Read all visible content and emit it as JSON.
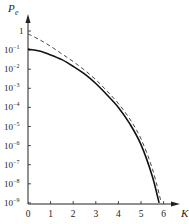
{
  "chart_data": {
    "type": "line",
    "title": "",
    "xlabel": "K",
    "ylabel": "P_e",
    "yscale": "log",
    "xlim": [
      0,
      6.5
    ],
    "ylim": [
      1e-09,
      1
    ],
    "grid": false,
    "legend": null,
    "x_ticks": [
      "0",
      "1",
      "2",
      "3",
      "4",
      "5",
      "6"
    ],
    "y_ticks": [
      "1",
      "10^-1",
      "10^-2",
      "10^-3",
      "10^-4",
      "10^-5",
      "10^-6",
      "10^-7",
      "10^-8",
      "10^-9"
    ],
    "series": [
      {
        "name": "solid",
        "style": "solid",
        "x": [
          0,
          0.5,
          1.0,
          1.5,
          2.0,
          2.5,
          3.0,
          3.5,
          4.0,
          4.5,
          5.0,
          5.5,
          5.8
        ],
        "log10y": [
          -0.95,
          -1.05,
          -1.25,
          -1.5,
          -1.85,
          -2.25,
          -2.75,
          -3.35,
          -4.0,
          -4.85,
          -5.95,
          -7.6,
          -9.0
        ]
      },
      {
        "name": "dashed",
        "style": "dashed",
        "x": [
          0,
          0.5,
          1.0,
          1.5,
          2.0,
          2.5,
          3.0,
          3.5,
          4.0,
          4.5,
          5.0,
          5.5,
          5.9
        ],
        "log10y": [
          -0.15,
          -0.45,
          -0.8,
          -1.2,
          -1.6,
          -2.05,
          -2.55,
          -3.15,
          -3.8,
          -4.6,
          -5.65,
          -7.2,
          -9.0
        ]
      }
    ]
  },
  "labels": {
    "y_axis": "P",
    "y_axis_sub": "e",
    "x_axis": "K"
  }
}
